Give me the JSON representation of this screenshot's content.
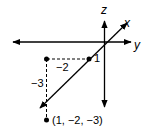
{
  "diagram": {
    "type": "3d-coordinate-plot",
    "axes": {
      "x_label": "x",
      "y_label": "y",
      "z_label": "z"
    },
    "tick_labels": {
      "x_tick": "1",
      "y_tick": "−2",
      "z_tick": "−3"
    },
    "point": {
      "label": "(1, −2, −3)",
      "coords": [
        1,
        -2,
        -3
      ]
    },
    "colors": {
      "line": "#000000",
      "background": "#ffffff"
    }
  }
}
